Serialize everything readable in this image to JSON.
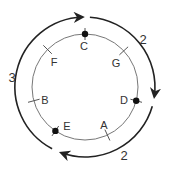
{
  "diagram": {
    "type": "circular-cycle",
    "center": [
      85,
      87
    ],
    "inner_radius": 53,
    "outer_radius": 70,
    "colors": {
      "inner_circle": "#777777",
      "outer_arc": "#222222",
      "dot": "#111111",
      "text": "#333333"
    },
    "nodes": [
      {
        "label": "C",
        "angle": -90,
        "marked": true,
        "label_pos": [
          84,
          50
        ]
      },
      {
        "label": "G",
        "angle": -43,
        "marked": false,
        "label_pos": [
          116,
          67
        ]
      },
      {
        "label": "D",
        "angle": 15,
        "marked": true,
        "label_pos": [
          124,
          104
        ]
      },
      {
        "label": "A",
        "angle": 65,
        "marked": false,
        "label_pos": [
          104,
          129
        ]
      },
      {
        "label": "E",
        "angle": 124,
        "marked": true,
        "label_pos": [
          67,
          130
        ]
      },
      {
        "label": "B",
        "angle": 165,
        "marked": false,
        "label_pos": [
          45,
          104
        ]
      },
      {
        "label": "F",
        "angle": -135,
        "marked": false,
        "label_pos": [
          54,
          66
        ]
      }
    ],
    "arcs": [
      {
        "label": "2",
        "from_angle": -86,
        "to_angle": 8,
        "label_pos": [
          143,
          44
        ]
      },
      {
        "label": "2",
        "from_angle": 16,
        "to_angle": 110,
        "label_pos": [
          124,
          160
        ]
      },
      {
        "label": "3",
        "from_angle": 118,
        "to_angle": 268,
        "label_pos": [
          12,
          82
        ]
      }
    ]
  }
}
